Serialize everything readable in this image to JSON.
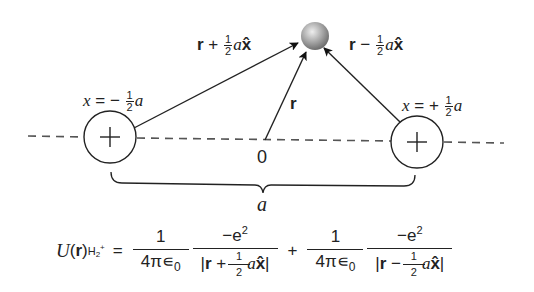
{
  "diagram": {
    "nuclei": [
      {
        "id": "left",
        "charge_symbol": "+",
        "position_label_prefix": "x = −",
        "position_label_num": "1",
        "position_label_den": "2",
        "position_label_var": "a",
        "center": [
          110,
          137
        ],
        "radius": 26
      },
      {
        "id": "right",
        "charge_symbol": "+",
        "position_label_prefix": "x = +",
        "position_label_num": "1",
        "position_label_den": "2",
        "position_label_var": "a",
        "center": [
          417,
          142
        ],
        "radius": 26
      }
    ],
    "electron": {
      "label": "electron",
      "center": [
        314,
        37
      ],
      "radius": 14,
      "color": "#a8a8a8"
    },
    "origin_label": "0",
    "vectors": {
      "r": "r",
      "left_vec_pre": "r + ",
      "left_vec_num": "1",
      "left_vec_den": "2",
      "left_vec_var": "a",
      "left_vec_unit": "x̂",
      "right_vec_pre": "r − ",
      "right_vec_num": "1",
      "right_vec_den": "2",
      "right_vec_var": "a",
      "right_vec_unit": "x̂"
    },
    "separation_label": "a",
    "colors": {
      "line": "#222222",
      "dash": "#555555",
      "electron_light": "#e6e6e6",
      "electron_dark": "#7a7a7a"
    }
  },
  "equation": {
    "lhs_U": "U",
    "lhs_r": "r",
    "lhs_sub": "H",
    "lhs_sub2": "2",
    "lhs_sub_plus": "+",
    "equals": "=",
    "term1_coef_num": "1",
    "term1_coef_den_pre": "4π∊",
    "term1_coef_den_sub": "0",
    "term1_num": "−e",
    "term1_num_sup": "2",
    "term1_den_bar_open": "|",
    "term1_den_r": "r",
    "term1_den_op": " + ",
    "term1_den_frac_num": "1",
    "term1_den_frac_den": "2",
    "term1_den_var": "a",
    "term1_den_unit": "x̂",
    "term1_den_bar_close": "|",
    "plus": "+",
    "term2_coef_num": "1",
    "term2_coef_den_pre": "4π∊",
    "term2_coef_den_sub": "0",
    "term2_num": "−e",
    "term2_num_sup": "2",
    "term2_den_bar_open": "|",
    "term2_den_r": "r",
    "term2_den_op": " − ",
    "term2_den_frac_num": "1",
    "term2_den_frac_den": "2",
    "term2_den_var": "a",
    "term2_den_unit": "x̂",
    "term2_den_bar_close": "|"
  }
}
